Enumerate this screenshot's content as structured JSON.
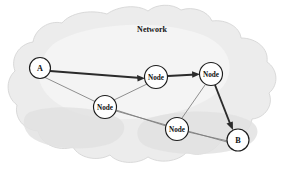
{
  "diagram": {
    "title": "Network",
    "type": "network-cloud-diagram",
    "colors": {
      "background": "#ffffff",
      "cloud_fill": "#ececec",
      "cloud_shade": "#e2e2e2",
      "cloud_outline": "#d2d2d2",
      "node_fill": "#ffffff",
      "node_stroke": "#1d1d1d",
      "edge_thin": "#7c7c7c",
      "edge_thick": "#2b2b2b",
      "text": "#111111"
    },
    "cloud": {
      "label": "Network",
      "label_x": 152,
      "label_y": 29
    },
    "nodes": [
      {
        "id": "A",
        "label": "A",
        "x": 40,
        "y": 68,
        "r": 10.5,
        "kind": "endpoint"
      },
      {
        "id": "N1",
        "label": "Node",
        "x": 156,
        "y": 77,
        "r": 11.5,
        "kind": "relay"
      },
      {
        "id": "N2",
        "label": "Node",
        "x": 211,
        "y": 74,
        "r": 11.5,
        "kind": "relay"
      },
      {
        "id": "N3",
        "label": "Node",
        "x": 105,
        "y": 107,
        "r": 11.5,
        "kind": "relay"
      },
      {
        "id": "N4",
        "label": "Node",
        "x": 177,
        "y": 129,
        "r": 11.5,
        "kind": "relay"
      },
      {
        "id": "B",
        "label": "B",
        "x": 238,
        "y": 140,
        "r": 11.0,
        "kind": "endpoint"
      }
    ],
    "edges": [
      {
        "from": "A",
        "to": "N1",
        "style": "thick",
        "arrow": true,
        "name": "edge-a-to-node1"
      },
      {
        "from": "N1",
        "to": "N2",
        "style": "thick",
        "arrow": true,
        "name": "edge-node1-to-node2"
      },
      {
        "from": "N2",
        "to": "B",
        "style": "thick",
        "arrow": true,
        "name": "edge-node2-to-b"
      },
      {
        "from": "A",
        "to": "N3",
        "style": "thin",
        "arrow": false,
        "name": "edge-a-to-node3"
      },
      {
        "from": "N3",
        "to": "N1",
        "style": "thin",
        "arrow": false,
        "name": "edge-node3-to-node1"
      },
      {
        "from": "N3",
        "to": "N4",
        "style": "thin",
        "arrow": false,
        "name": "edge-node3-to-node4"
      },
      {
        "from": "N4",
        "to": "N2",
        "style": "thin",
        "arrow": false,
        "name": "edge-node4-to-node2"
      },
      {
        "from": "N4",
        "to": "B",
        "style": "thin",
        "arrow": false,
        "name": "edge-node4-to-b"
      }
    ]
  }
}
